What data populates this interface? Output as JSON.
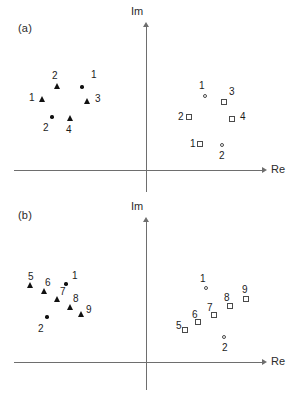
{
  "figure": {
    "width": 298,
    "height": 395,
    "background": "#ffffff",
    "marker_color_filled": "#111111",
    "marker_color_open": "#4a4a4a",
    "axis_color": "#6e6e6e"
  },
  "panels": [
    {
      "id": "a",
      "label": "(a)",
      "axis_x_label": "Re",
      "axis_y_label": "Im"
    },
    {
      "id": "b",
      "label": "(b)",
      "axis_x_label": "Re",
      "axis_y_label": "Im"
    }
  ],
  "chart_data": {
    "type": "scatter",
    "title": "",
    "xlabel": "Re",
    "ylabel": "Im",
    "grid": false,
    "legend": "none",
    "axes": {
      "origin_marked": false,
      "ticks": [],
      "tick_labels": [],
      "xlim": null,
      "ylim": null
    },
    "panels": [
      {
        "id": "a",
        "label": "(a)",
        "axis_origin_px": {
          "x": 146,
          "y": 170
        },
        "series": [
          {
            "name": "left-filled-triangles",
            "marker": "filled-triangle",
            "quadrant": "second",
            "points": [
              {
                "label": "1",
                "px": {
                  "x": 42,
                  "y": 99
                },
                "label_px": {
                  "x": 29,
                  "y": 93
                }
              },
              {
                "label": "2",
                "px": {
                  "x": 57,
                  "y": 86
                },
                "label_px": {
                  "x": 52,
                  "y": 71
                }
              },
              {
                "label": "3",
                "px": {
                  "x": 87,
                  "y": 101
                },
                "label_px": {
                  "x": 95,
                  "y": 94
                }
              },
              {
                "label": "4",
                "px": {
                  "x": 70,
                  "y": 118
                },
                "label_px": {
                  "x": 66,
                  "y": 125
                }
              }
            ]
          },
          {
            "name": "left-filled-circles",
            "marker": "filled-circle",
            "quadrant": "second",
            "points": [
              {
                "label": "1",
                "px": {
                  "x": 82,
                  "y": 87
                },
                "label_px": {
                  "x": 91,
                  "y": 70
                }
              },
              {
                "label": "2",
                "px": {
                  "x": 52,
                  "y": 117
                },
                "label_px": {
                  "x": 43,
                  "y": 123
                }
              }
            ]
          },
          {
            "name": "right-open-squares",
            "marker": "open-square",
            "quadrant": "first",
            "points": [
              {
                "label": "1",
                "px": {
                  "x": 200,
                  "y": 144
                },
                "label_px": {
                  "x": 190,
                  "y": 139
                }
              },
              {
                "label": "2",
                "px": {
                  "x": 189,
                  "y": 117
                },
                "label_px": {
                  "x": 178,
                  "y": 112
                }
              },
              {
                "label": "3",
                "px": {
                  "x": 224,
                  "y": 102
                },
                "label_px": {
                  "x": 229,
                  "y": 87
                }
              },
              {
                "label": "4",
                "px": {
                  "x": 232,
                  "y": 119
                },
                "label_px": {
                  "x": 240,
                  "y": 112
                }
              }
            ]
          },
          {
            "name": "right-open-circles",
            "marker": "open-circle",
            "quadrant": "first",
            "points": [
              {
                "label": "1",
                "px": {
                  "x": 205,
                  "y": 96
                },
                "label_px": {
                  "x": 199,
                  "y": 81
                }
              },
              {
                "label": "2",
                "px": {
                  "x": 222,
                  "y": 145
                },
                "label_px": {
                  "x": 219,
                  "y": 151
                }
              }
            ]
          }
        ]
      },
      {
        "id": "b",
        "label": "(b)",
        "axis_origin_px": {
          "x": 146,
          "y": 362
        },
        "series": [
          {
            "name": "left-filled-triangles",
            "marker": "filled-triangle",
            "quadrant": "second",
            "points": [
              {
                "label": "5",
                "px": {
                  "x": 30,
                  "y": 285
                },
                "label_px": {
                  "x": 28,
                  "y": 272
                }
              },
              {
                "label": "6",
                "px": {
                  "x": 44,
                  "y": 291
                },
                "label_px": {
                  "x": 45,
                  "y": 278
                }
              },
              {
                "label": "7",
                "px": {
                  "x": 57,
                  "y": 299
                },
                "label_px": {
                  "x": 60,
                  "y": 287
                }
              },
              {
                "label": "8",
                "px": {
                  "x": 70,
                  "y": 307
                },
                "label_px": {
                  "x": 73,
                  "y": 294
                }
              },
              {
                "label": "9",
                "px": {
                  "x": 81,
                  "y": 314
                },
                "label_px": {
                  "x": 86,
                  "y": 305
                }
              }
            ]
          },
          {
            "name": "left-filled-circles",
            "marker": "filled-circle",
            "quadrant": "second",
            "points": [
              {
                "label": "1",
                "px": {
                  "x": 66,
                  "y": 284
                },
                "label_px": {
                  "x": 72,
                  "y": 271
                }
              },
              {
                "label": "2",
                "px": {
                  "x": 47,
                  "y": 317
                },
                "label_px": {
                  "x": 38,
                  "y": 324
                }
              }
            ]
          },
          {
            "name": "right-open-squares",
            "marker": "open-square",
            "quadrant": "first",
            "points": [
              {
                "label": "5",
                "px": {
                  "x": 185,
                  "y": 330
                },
                "label_px": {
                  "x": 176,
                  "y": 321
                }
              },
              {
                "label": "6",
                "px": {
                  "x": 198,
                  "y": 322
                },
                "label_px": {
                  "x": 192,
                  "y": 310
                }
              },
              {
                "label": "7",
                "px": {
                  "x": 214,
                  "y": 315
                },
                "label_px": {
                  "x": 207,
                  "y": 303
                }
              },
              {
                "label": "8",
                "px": {
                  "x": 230,
                  "y": 306
                },
                "label_px": {
                  "x": 224,
                  "y": 293
                }
              },
              {
                "label": "9",
                "px": {
                  "x": 246,
                  "y": 299
                },
                "label_px": {
                  "x": 242,
                  "y": 285
                }
              }
            ]
          },
          {
            "name": "right-open-circles",
            "marker": "open-circle",
            "quadrant": "first",
            "points": [
              {
                "label": "1",
                "px": {
                  "x": 206,
                  "y": 288
                },
                "label_px": {
                  "x": 200,
                  "y": 274
                }
              },
              {
                "label": "2",
                "px": {
                  "x": 224,
                  "y": 337
                },
                "label_px": {
                  "x": 222,
                  "y": 343
                }
              }
            ]
          }
        ]
      }
    ]
  }
}
